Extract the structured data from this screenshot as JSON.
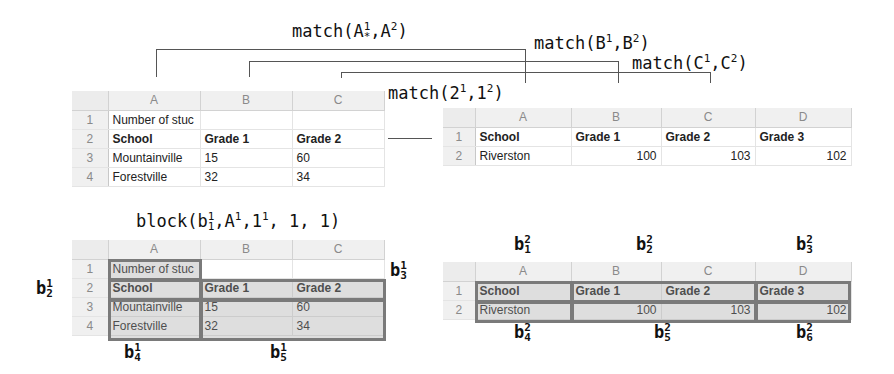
{
  "formulas": {
    "match_A": {
      "fn": "match(",
      "a": "A",
      "a_sup": "1",
      "a_sub": "*",
      "b": "A",
      "b_sup": "2"
    },
    "match_B": {
      "fn": "match(",
      "a": "B",
      "a_sup": "1",
      "b": "B",
      "b_sup": "2"
    },
    "match_C": {
      "fn": "match(",
      "a": "C",
      "a_sup": "1",
      "b": "C",
      "b_sup": "2"
    },
    "match_rows": {
      "fn": "match(",
      "a": "2",
      "a_sup": "1",
      "b": "1",
      "b_sup": "2"
    },
    "block": {
      "fn": "block(",
      "a": "b",
      "a_sup": "1",
      "a_sub": "1",
      "b": "A",
      "b_sup": "1",
      "c": "1",
      "c_sup": "1",
      "tail": ", 1, 1)"
    }
  },
  "sheet1": {
    "columns": [
      "A",
      "B",
      "C"
    ],
    "rows": [
      {
        "n": "1",
        "cells": [
          "Number of stuc",
          "",
          ""
        ]
      },
      {
        "n": "2",
        "cells": [
          "School",
          "Grade 1",
          "Grade 2"
        ]
      },
      {
        "n": "3",
        "cells": [
          "Mountainville",
          "15",
          "60"
        ]
      },
      {
        "n": "4",
        "cells": [
          "Forestville",
          "32",
          "34"
        ]
      }
    ]
  },
  "sheet2": {
    "columns": [
      "A",
      "B",
      "C",
      "D"
    ],
    "rows": [
      {
        "n": "1",
        "cells": [
          "School",
          "Grade 1",
          "Grade 2",
          "Grade 3"
        ]
      },
      {
        "n": "2",
        "cells": [
          "Riverston",
          "100",
          "103",
          "102"
        ]
      }
    ]
  },
  "block_labels_1": [
    {
      "b": "b",
      "sup": "1",
      "sub": "2"
    },
    {
      "b": "b",
      "sup": "1",
      "sub": "3"
    },
    {
      "b": "b",
      "sup": "1",
      "sub": "4"
    },
    {
      "b": "b",
      "sup": "1",
      "sub": "5"
    }
  ],
  "block_labels_2": [
    {
      "b": "b",
      "sup": "2",
      "sub": "1"
    },
    {
      "b": "b",
      "sup": "2",
      "sub": "2"
    },
    {
      "b": "b",
      "sup": "2",
      "sub": "3"
    },
    {
      "b": "b",
      "sup": "2",
      "sub": "4"
    },
    {
      "b": "b",
      "sup": "2",
      "sub": "5"
    },
    {
      "b": "b",
      "sup": "2",
      "sub": "6"
    }
  ],
  "colors": {
    "line": "#555555",
    "block_border": "#7a7a7a",
    "header_bg": "#f0f0f0"
  }
}
